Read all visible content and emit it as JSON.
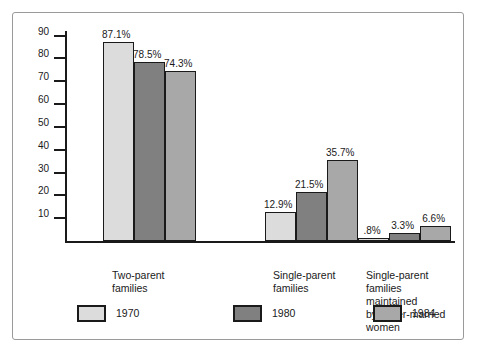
{
  "chart_data": {
    "type": "bar",
    "title": "",
    "xlabel": "",
    "ylabel": "",
    "ylim": [
      0,
      92
    ],
    "grid": false,
    "legend_position": "bottom",
    "y_ticks": [
      90,
      80,
      70,
      60,
      50,
      40,
      30,
      20,
      10
    ],
    "categories": [
      "Two-parent\nfamilies",
      "Single-parent\nfamilies",
      "Single-parent\nfamilies maintained\nby never-married women"
    ],
    "series": [
      {
        "name": "1970",
        "color": "#dcdcdc",
        "values": [
          87.1,
          12.9,
          0.8
        ],
        "labels": [
          "87.1%",
          "12.9%",
          ".8%"
        ]
      },
      {
        "name": "1980",
        "color": "#808080",
        "values": [
          78.5,
          21.5,
          3.3
        ],
        "labels": [
          "78.5%",
          "21.5%",
          "3.3%"
        ]
      },
      {
        "name": "1984",
        "color": "#a8a8a8",
        "values": [
          74.3,
          35.7,
          6.6
        ],
        "labels": [
          "74.3%",
          "35.7%",
          "6.6%"
        ]
      }
    ]
  }
}
